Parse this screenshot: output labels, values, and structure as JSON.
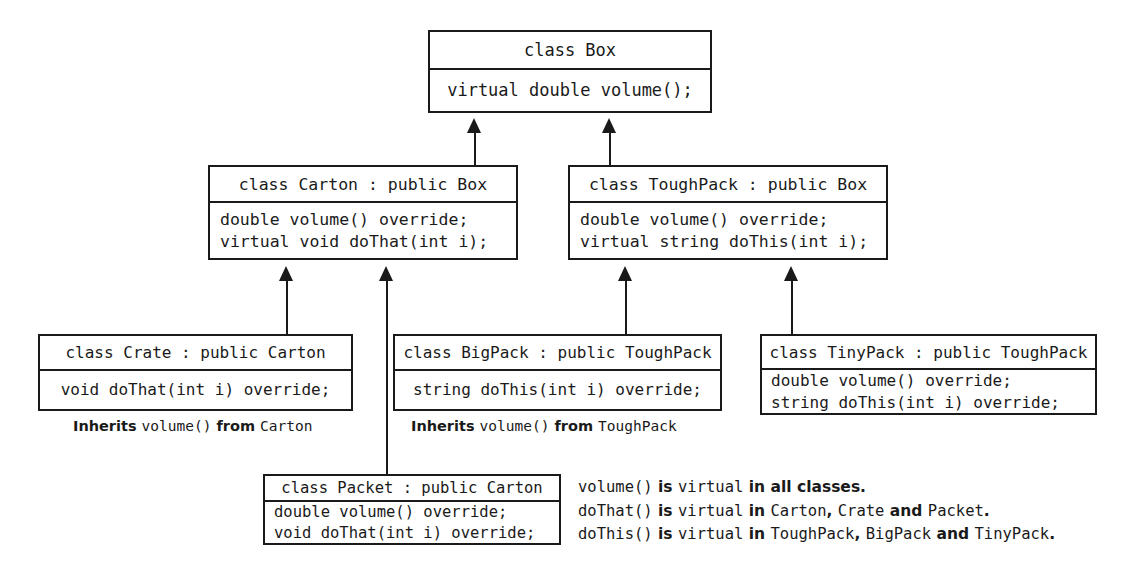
{
  "diagram": {
    "ink_color": "#1a1a1a",
    "background_color": "#ffffff",
    "classes": {
      "box": {
        "title": "class Box",
        "members": [
          "virtual double volume();"
        ]
      },
      "carton": {
        "title": "class Carton : public Box",
        "members": [
          "double volume() override;",
          "virtual void doThat(int i);"
        ]
      },
      "toughpack": {
        "title": "class ToughPack : public Box",
        "members": [
          "double volume() override;",
          "virtual string doThis(int i);"
        ]
      },
      "crate": {
        "title": "class Crate : public Carton",
        "members": [
          "void doThat(int i) override;"
        ]
      },
      "bigpack": {
        "title": "class BigPack : public ToughPack",
        "members": [
          "string doThis(int i) override;"
        ]
      },
      "tinypack": {
        "title": "class TinyPack : public ToughPack",
        "members": [
          "double volume() override;",
          "string doThis(int i) override;"
        ]
      },
      "packet": {
        "title": "class Packet : public Carton",
        "members": [
          "double volume() override;",
          "void doThat(int i) override;"
        ]
      }
    },
    "captions": {
      "crate_inherits": {
        "prefix": "Inherits ",
        "member": "volume()",
        "middle": " from ",
        "source": "Carton"
      },
      "bigpack_inherits": {
        "prefix": "Inherits ",
        "member": "volume()",
        "middle": " from ",
        "source": "ToughPack"
      }
    },
    "legend": [
      {
        "func": "volume()",
        "is": " is ",
        "virtual": "virtual",
        "in": " in ",
        "scope_sans": "all classes",
        "scope_mono": "",
        "sep1": "",
        "scope_mono2": "",
        "and": "",
        "scope_mono3": "",
        "period": "."
      },
      {
        "func": "doThat()",
        "is": " is ",
        "virtual": "virtual",
        "in": " in ",
        "scope_sans": "",
        "scope_mono": "Carton",
        "sep1": ", ",
        "scope_mono2": "Crate",
        "and": " and ",
        "scope_mono3": "Packet",
        "period": "."
      },
      {
        "func": "doThis()",
        "is": " is ",
        "virtual": "virtual",
        "in": " in ",
        "scope_sans": "",
        "scope_mono": "ToughPack",
        "sep1": ", ",
        "scope_mono2": "BigPack",
        "and": " and ",
        "scope_mono3": "TinyPack",
        "period": "."
      }
    ],
    "edges": [
      {
        "name": "carton-to-box",
        "from": "carton",
        "to": "box"
      },
      {
        "name": "toughpack-to-box",
        "from": "toughpack",
        "to": "box"
      },
      {
        "name": "crate-to-carton",
        "from": "crate",
        "to": "carton"
      },
      {
        "name": "packet-to-carton",
        "from": "packet",
        "to": "carton"
      },
      {
        "name": "bigpack-to-toughpack",
        "from": "bigpack",
        "to": "toughpack"
      },
      {
        "name": "tinypack-to-toughpack",
        "from": "tinypack",
        "to": "toughpack"
      }
    ]
  }
}
